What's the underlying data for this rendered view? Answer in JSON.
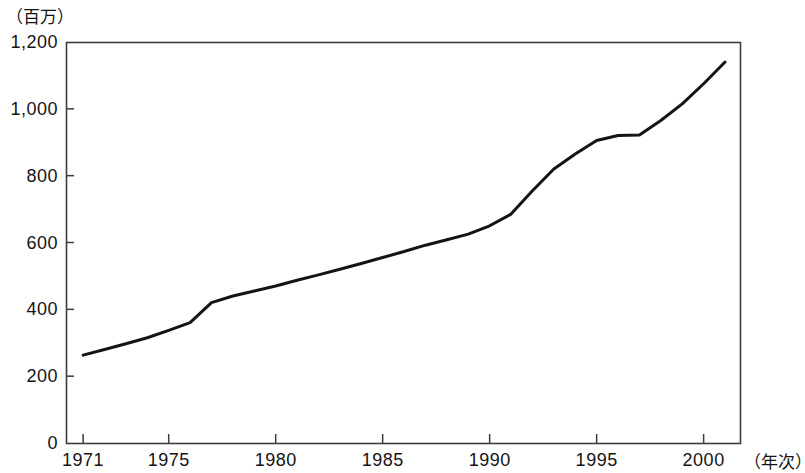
{
  "chart_data": {
    "type": "line",
    "title": "",
    "subtitle": "",
    "xlabel": "（年次）",
    "ylabel": "（百万）",
    "unit_note": "（百万）",
    "grid": false,
    "legend": null,
    "legend_position": "none",
    "xlim": [
      1970.2,
      2001.7
    ],
    "ylim": [
      0,
      1200
    ],
    "yticks": [
      0,
      200,
      400,
      600,
      800,
      1000,
      1200
    ],
    "ytick_labels": [
      "0",
      "200",
      "400",
      "600",
      "800",
      "1,000",
      "1,200"
    ],
    "xticks": [
      1971,
      1975,
      1980,
      1985,
      1990,
      1995,
      2000
    ],
    "xtick_labels": [
      "1971",
      "1975",
      "1980",
      "1985",
      "1990",
      "1995",
      "2000"
    ],
    "series": [
      {
        "name": "total",
        "x": [
          1971,
          1972,
          1973,
          1974,
          1975,
          1976,
          1977,
          1978,
          1979,
          1980,
          1981,
          1982,
          1983,
          1984,
          1985,
          1986,
          1987,
          1988,
          1989,
          1990,
          1991,
          1992,
          1993,
          1994,
          1995,
          1996,
          1997,
          1998,
          1999,
          2000,
          2001
        ],
        "values": [
          263,
          280,
          297,
          315,
          337,
          360,
          420,
          440,
          455,
          470,
          487,
          503,
          520,
          537,
          555,
          573,
          592,
          608,
          625,
          650,
          685,
          755,
          820,
          865,
          905,
          920,
          922,
          965,
          1015,
          1075,
          1140
        ]
      }
    ],
    "colors": {
      "line": "#141414",
      "axis": "#3c3c3c",
      "background": "#ffffff",
      "text": "#141414"
    },
    "line_width_px": 3
  },
  "axes_geometry": {
    "plot_left_px": 66,
    "plot_right_px": 740,
    "plot_top_px": 42,
    "plot_bottom_px": 443
  }
}
